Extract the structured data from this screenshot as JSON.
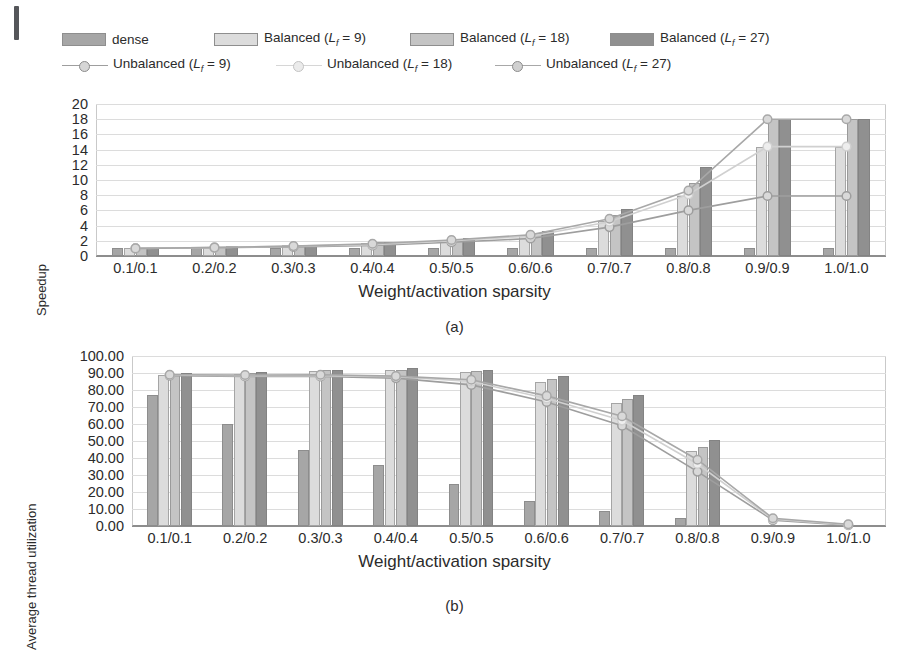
{
  "figure": {
    "caption_a": "(a)",
    "caption_b": "(b)"
  },
  "legend": {
    "items": [
      {
        "name": "dense",
        "kind": "bar",
        "color": "#a6a6a6"
      },
      {
        "name": "Balanced (Lf = 9)",
        "kind": "bar",
        "color": "#dcdcdc",
        "label_prefix": "Balanced (",
        "sub": "f",
        "label_suffix": " = 9)"
      },
      {
        "name": "Balanced (Lf = 18)",
        "kind": "bar",
        "color": "#c4c4c4",
        "label_prefix": "Balanced (",
        "sub": "f",
        "label_suffix": " = 18)"
      },
      {
        "name": "Balanced (Lf = 27)",
        "kind": "bar",
        "color": "#909090",
        "label_prefix": "Balanced (",
        "sub": "f",
        "label_suffix": " = 27)"
      },
      {
        "name": "Unbalanced (Lf = 9)",
        "kind": "line",
        "color": "#9e9e9e",
        "label_prefix": "Unbalanced (",
        "sub": "f",
        "label_suffix": " = 9)"
      },
      {
        "name": "Unbalanced (Lf = 18)",
        "kind": "line",
        "color": "#d0d0d0",
        "label_prefix": "Unbalanced (",
        "sub": "f",
        "label_suffix": " = 18)"
      },
      {
        "name": "Unbalanced (Lf = 27)",
        "kind": "line",
        "color": "#a8a8a8",
        "label_prefix": "Unbalanced (",
        "sub": "f",
        "label_suffix": " = 27)"
      }
    ]
  },
  "chart_data": [
    {
      "id": "a",
      "type": "bar",
      "title": "",
      "xlabel": "Weight/activation sparsity",
      "ylabel": "Speedup",
      "categories": [
        "0.1/0.1",
        "0.2/0.2",
        "0.3/0.3",
        "0.4/0.4",
        "0.5/0.5",
        "0.6/0.6",
        "0.7/0.7",
        "0.8/0.8",
        "0.9/0.9",
        "1.0/1.0"
      ],
      "ylim": [
        0,
        20
      ],
      "yticks": [
        0,
        2,
        4,
        6,
        8,
        10,
        12,
        14,
        16,
        18,
        20
      ],
      "ytick_labels": [
        "0",
        "2",
        "4",
        "6",
        "8",
        "10",
        "12",
        "14",
        "16",
        "18",
        "20"
      ],
      "grid": true,
      "legend_position": "top",
      "series": [
        {
          "name": "dense",
          "kind": "bar",
          "color": "#a6a6a6",
          "values": [
            1.0,
            1.0,
            1.0,
            1.0,
            1.0,
            1.0,
            1.0,
            1.0,
            1.0,
            1.0
          ]
        },
        {
          "name": "Balanced (Lf = 9)",
          "kind": "bar",
          "color": "#dcdcdc",
          "values": [
            1.1,
            1.2,
            1.4,
            1.7,
            2.1,
            2.7,
            4.6,
            7.9,
            14.4,
            14.4
          ]
        },
        {
          "name": "Balanced (Lf = 18)",
          "kind": "bar",
          "color": "#c4c4c4",
          "values": [
            1.1,
            1.2,
            1.4,
            1.8,
            2.2,
            3.0,
            5.4,
            9.6,
            18.0,
            18.0
          ]
        },
        {
          "name": "Balanced (Lf = 27)",
          "kind": "bar",
          "color": "#909090",
          "values": [
            1.1,
            1.3,
            1.5,
            1.9,
            2.4,
            3.3,
            6.2,
            11.7,
            18.0,
            18.0
          ]
        },
        {
          "name": "Unbalanced (Lf = 9)",
          "kind": "line",
          "color": "#9e9e9e",
          "values": [
            1.0,
            1.1,
            1.2,
            1.4,
            1.8,
            2.3,
            3.8,
            6.0,
            7.9,
            7.9
          ]
        },
        {
          "name": "Unbalanced (Lf = 18)",
          "kind": "line",
          "color": "#d0d0d0",
          "values": [
            1.0,
            1.1,
            1.3,
            1.5,
            2.0,
            2.6,
            4.5,
            8.1,
            14.4,
            14.4
          ]
        },
        {
          "name": "Unbalanced (Lf = 27)",
          "kind": "line",
          "color": "#a8a8a8",
          "values": [
            1.0,
            1.1,
            1.3,
            1.6,
            2.1,
            2.8,
            4.9,
            8.6,
            18.0,
            18.0
          ]
        }
      ]
    },
    {
      "id": "b",
      "type": "bar",
      "title": "",
      "xlabel": "Weight/activation sparsity",
      "ylabel": "Average thread utilization",
      "categories": [
        "0.1/0.1",
        "0.2/0.2",
        "0.3/0.3",
        "0.4/0.4",
        "0.5/0.5",
        "0.6/0.6",
        "0.7/0.7",
        "0.8/0.8",
        "0.9/0.9",
        "1.0/1.0"
      ],
      "ylim": [
        0,
        100
      ],
      "yticks": [
        0,
        10,
        20,
        30,
        40,
        50,
        60,
        70,
        80,
        90,
        100
      ],
      "ytick_labels": [
        "0.00",
        "10.00",
        "20.00",
        "30.00",
        "40.00",
        "50.00",
        "60.00",
        "70.00",
        "80.00",
        "90.00",
        "100.00"
      ],
      "grid": true,
      "legend_position": "top",
      "series": [
        {
          "name": "dense",
          "kind": "bar",
          "color": "#a6a6a6",
          "values": [
            77.0,
            60.0,
            45.0,
            36.0,
            25.0,
            15.0,
            9.0,
            5.0,
            0.0,
            0.0
          ]
        },
        {
          "name": "Balanced (Lf = 9)",
          "kind": "bar",
          "color": "#dcdcdc",
          "values": [
            89.0,
            89.5,
            91.0,
            91.5,
            90.5,
            85.0,
            72.5,
            44.0,
            0.0,
            0.0
          ]
        },
        {
          "name": "Balanced (Lf = 18)",
          "kind": "bar",
          "color": "#c4c4c4",
          "values": [
            89.5,
            90.0,
            91.5,
            92.0,
            91.0,
            86.5,
            74.5,
            46.5,
            0.0,
            0.0
          ]
        },
        {
          "name": "Balanced (Lf = 27)",
          "kind": "bar",
          "color": "#909090",
          "values": [
            90.0,
            90.5,
            92.0,
            93.0,
            92.0,
            88.0,
            77.0,
            50.5,
            0.0,
            0.0
          ]
        },
        {
          "name": "Unbalanced (Lf = 9)",
          "kind": "line",
          "color": "#9e9e9e",
          "values": [
            88.5,
            88.0,
            88.0,
            87.0,
            83.0,
            73.0,
            59.0,
            32.0,
            3.5,
            0.5
          ]
        },
        {
          "name": "Unbalanced (Lf = 18)",
          "kind": "line",
          "color": "#d0d0d0",
          "values": [
            88.8,
            88.4,
            88.5,
            87.8,
            85.0,
            75.0,
            62.0,
            36.5,
            4.0,
            0.8
          ]
        },
        {
          "name": "Unbalanced (Lf = 27)",
          "kind": "line",
          "color": "#a8a8a8",
          "values": [
            89.0,
            88.8,
            89.0,
            88.2,
            86.0,
            76.5,
            64.5,
            39.0,
            4.5,
            1.0
          ]
        }
      ]
    }
  ]
}
